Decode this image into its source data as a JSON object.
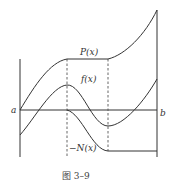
{
  "diagram": {
    "caption": "图 3–9",
    "labels": {
      "a": "a",
      "b": "b",
      "P": "P(x)",
      "f": "f(x)",
      "N": "−N(x)"
    },
    "curves": [
      {
        "name": "P(x)",
        "description": "positive variation: rises from a to first extremum, constant between dashed lines, then rises to b"
      },
      {
        "name": "f(x)",
        "description": "function oscillating: starts below axis, peaks at first dashed line, troughs at second dashed line, rises to b"
      },
      {
        "name": "-N(x)",
        "description": "negative variation: zero until first dashed line, decreases to second dashed line, then constant"
      }
    ],
    "colors": {
      "line": "#333333",
      "background": "#ffffff"
    }
  }
}
